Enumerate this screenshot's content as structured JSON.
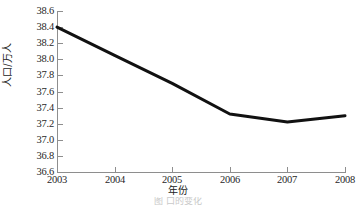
{
  "chart_data": {
    "type": "line",
    "title": "",
    "xlabel": "年份",
    "ylabel": "人口/万人",
    "categories": [
      "2003",
      "2004",
      "2005",
      "2006",
      "2007",
      "2008"
    ],
    "x": [
      2003,
      2004,
      2005,
      2006,
      2007,
      2008
    ],
    "series": [
      {
        "name": "人口/万人",
        "values": [
          38.4,
          38.05,
          37.7,
          37.32,
          37.22,
          37.3
        ],
        "color": "#111111",
        "line_width": 3,
        "markers": false
      }
    ],
    "ylim": [
      36.6,
      38.6
    ],
    "xlim": [
      2003,
      2008
    ],
    "ytick_labels": [
      "38.6",
      "38.4",
      "38.2",
      "38.0",
      "37.8",
      "37.6",
      "37.4",
      "37.2",
      "37.0",
      "36.8",
      "36.6"
    ],
    "ytick_values": [
      38.6,
      38.4,
      38.2,
      38.0,
      37.8,
      37.6,
      37.4,
      37.2,
      37.0,
      36.8,
      36.6
    ],
    "xtick_labels": [
      "2003",
      "2004",
      "2005",
      "2006",
      "2007",
      "2008"
    ],
    "grid": false,
    "legend": "none",
    "axis_color": "#8e8e8e",
    "background": "#ffffff"
  },
  "caption": {
    "text": "图       口的变化"
  }
}
